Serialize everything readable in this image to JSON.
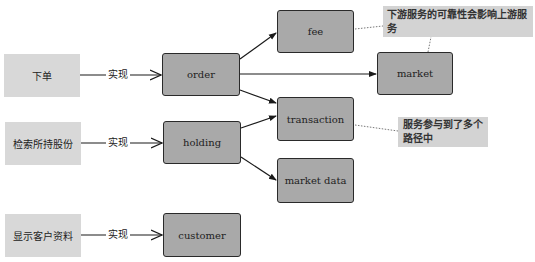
{
  "features": [
    {
      "id": "place-order",
      "label": "下单"
    },
    {
      "id": "search-holdings",
      "label": "检索所持股份"
    },
    {
      "id": "show-customer",
      "label": "显示客户资料"
    }
  ],
  "relation_label": "实现",
  "services": {
    "order": "order",
    "holding": "holding",
    "customer": "customer",
    "fee": "fee",
    "market": "market",
    "transaction": "transaction",
    "market_data": "market data"
  },
  "notes": [
    {
      "id": "reliability-note",
      "text": "下游服务的可靠性会影响上游服务"
    },
    {
      "id": "multipath-note",
      "text": "服务参与到了多个路径中"
    }
  ],
  "colors": {
    "feature_fill": "#d8d8d8",
    "service_fill": "#a9a9a9",
    "note_fill": "#d3d3d3",
    "stroke": "#2a2a2a"
  }
}
